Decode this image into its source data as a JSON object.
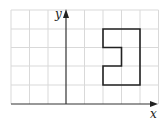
{
  "diagram": {
    "type": "coordinate-grid",
    "grid": {
      "color": "#d9d9d9",
      "cell_px": 18.5,
      "origin_px": [
        66,
        104
      ],
      "x_range": [
        -3,
        5
      ],
      "y_range": [
        0,
        5
      ]
    },
    "axes": {
      "color": "#333333",
      "x_label": "x",
      "y_label": "y"
    },
    "shape": {
      "name": "notched-polygon",
      "stroke": "#222222",
      "vertices": [
        [
          2,
          4
        ],
        [
          4,
          4
        ],
        [
          4,
          1
        ],
        [
          2,
          1
        ],
        [
          2,
          2
        ],
        [
          3,
          2
        ],
        [
          3,
          3
        ],
        [
          2,
          3
        ]
      ]
    }
  }
}
